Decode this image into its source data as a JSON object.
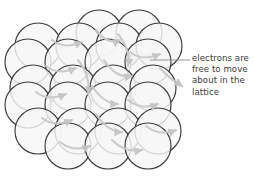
{
  "figure": {
    "kind": "metallic-lattice-diagram",
    "background_color": "#ffffff"
  },
  "annotation": {
    "full_text": "electrons are free to move about in the lattice",
    "lines": [
      "electrons are",
      "free to move",
      "about in the",
      "lattice"
    ],
    "text_color": "#3b3b3b",
    "leader_line_color": "#8a8a8a"
  },
  "lattice": {
    "ion_fill_color": "#f6f6f6",
    "ion_stroke_color": "#3a3a3a",
    "electron_arrow_color": "#c4c4c4",
    "ion_radius": 23,
    "rows": [
      {
        "y": 33,
        "xs": [
          99,
          139
        ]
      },
      {
        "y": 46,
        "xs": [
          38,
          79,
          119,
          159
        ]
      },
      {
        "y": 62,
        "xs": [
          28,
          68,
          108,
          148
        ]
      },
      {
        "y": 88,
        "xs": [
          33,
          73,
          113,
          153
        ]
      },
      {
        "y": 105,
        "xs": [
          28,
          68,
          108,
          148
        ]
      },
      {
        "y": 131,
        "xs": [
          38,
          78,
          118,
          158
        ]
      },
      {
        "y": 146,
        "xs": [
          68,
          108,
          148
        ]
      }
    ],
    "electron_arrows": [
      {
        "path": "M 52 40 C 62 48, 72 46, 82 42",
        "head": [
          82,
          42,
          20
        ]
      },
      {
        "path": "M 96 30 C 104 40, 112 44, 120 40",
        "head": [
          120,
          40,
          15
        ]
      },
      {
        "path": "M 130 52 C 140 60, 150 58, 160 54",
        "head": [
          160,
          54,
          18
        ]
      },
      {
        "path": "M 46 66 C 56 74, 66 72, 76 68",
        "head": [
          76,
          68,
          20
        ]
      },
      {
        "path": "M 104 60 C 112 72, 120 78, 132 76",
        "head": [
          132,
          76,
          10
        ]
      },
      {
        "path": "M 160 68 C 168 78, 176 82, 182 86",
        "head": [
          182,
          86,
          40
        ]
      },
      {
        "path": "M 36 92 C 46 100, 56 98, 66 94",
        "head": [
          66,
          94,
          20
        ]
      },
      {
        "path": "M 92 86 C 100 98, 108 104, 118 104",
        "head": [
          118,
          104,
          5
        ]
      },
      {
        "path": "M 128 100 C 138 108, 148 108, 158 104",
        "head": [
          158,
          104,
          18
        ]
      },
      {
        "path": "M 42 118 C 52 126, 62 124, 72 120",
        "head": [
          72,
          120,
          20
        ]
      },
      {
        "path": "M 96 114 C 104 126, 112 132, 122 132",
        "head": [
          122,
          132,
          5
        ]
      },
      {
        "path": "M 146 126 C 156 134, 166 134, 176 130",
        "head": [
          176,
          130,
          18
        ]
      },
      {
        "path": "M 60 142 C 70 150, 80 150, 90 146",
        "head": [
          90,
          146,
          18
        ]
      },
      {
        "path": "M 112 140 C 122 150, 132 152, 142 150",
        "head": [
          142,
          150,
          8
        ]
      },
      {
        "path": "M 78 60 C 86 70, 90 82, 88 94",
        "head": [
          88,
          94,
          100
        ]
      },
      {
        "path": "M 118 34 C 126 44, 130 56, 128 66",
        "head": [
          128,
          66,
          100
        ]
      }
    ],
    "leader": {
      "x1": 150,
      "y1": 60,
      "x2": 190,
      "y2": 60
    }
  }
}
